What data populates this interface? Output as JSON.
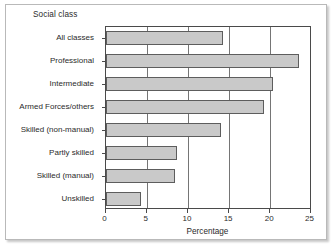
{
  "chart_data": {
    "type": "bar",
    "orientation": "horizontal",
    "title": "Social class",
    "subtitle": "",
    "xlabel": "Percentage",
    "ylabel": "",
    "xlim": [
      0,
      25
    ],
    "xticks": [
      0,
      5,
      10,
      15,
      20,
      25
    ],
    "xticklabels": [
      "0",
      "5",
      "10",
      "15",
      "20",
      "25"
    ],
    "grid": "vertical",
    "legend": "none",
    "categories": [
      "All classes",
      "Professional",
      "Intermediate",
      "Armed Forces/others",
      "Skilled (non-manual)",
      "Partly skilled",
      "Skilled (manual)",
      "Unskilled"
    ],
    "values": [
      14.4,
      23.7,
      20.5,
      19.4,
      14.1,
      8.8,
      8.5,
      4.3
    ],
    "bar_fill_color": "#c9c9c9",
    "bar_edge_color": "#5d5d5d",
    "axis_color": "#4a4a4a",
    "gridline_color": "#757575",
    "background_color": "#ffffff",
    "frame_border_color": "#b9b9b9"
  }
}
